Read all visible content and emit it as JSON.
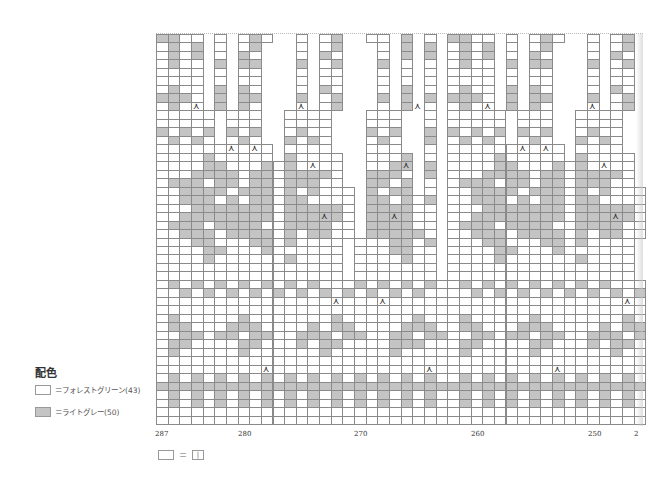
{
  "legend": {
    "title": "配色",
    "items": [
      {
        "swatch": "white",
        "label": "＝フォレストグリーン(43)"
      },
      {
        "swatch": "grey",
        "label": "＝ライトグレー(50)"
      }
    ]
  },
  "key": {
    "equals": "＝",
    "symbol": "|"
  },
  "axis": {
    "labels": [
      {
        "text": "287",
        "x": 155
      },
      {
        "text": "280",
        "x": 238
      },
      {
        "text": "270",
        "x": 354
      },
      {
        "text": "260",
        "x": 471
      },
      {
        "text": "250",
        "x": 588
      },
      {
        "text": "2",
        "x": 634
      }
    ]
  },
  "colors": {
    "white_cell": "#ffffff",
    "grey_cell": "#c4c4c4",
    "grid_line": "#8a8a8a"
  },
  "chart": {
    "left": 156,
    "top": 34,
    "cell_w": 11.65,
    "cell_h": 8.48,
    "rows": 46,
    "cols": 42,
    "repeat_width": 25,
    "motif": [
      "xxoo.o.oxo..o.ox..oo.x.o.",
      "oxox.o.ox...o.ox...o.x.x.",
      "oxox.o.xo...o.xo...o.x.x.",
      "oxoo.x.xx...x.ox...x.o.o.",
      "oooo.o.oo...o.oo...o.o.o.",
      "oooo.o.oo...o.oo...o.o.o.",
      "oxoo.x.xo...o.xo...o.x.o.",
      "xxxo.x.xx...x.ox...x.x.x.",
      "oxoo.x.xo...o.ox...o.x.o.",
      "ooooo.ooo..oooo...ooo..o.",
      "ooooo.ooo..oooo...ooo..o.",
      "xoxox.xox..oxoo...xox..x.",
      "oxoxo.oxo..xoxo...oxo..x.",
      "oooooooooo.oooo...ooo..o.",
      "ooooxooooo.xoooo..ooox.o.",
      "ooooxxoooxoxoooo..ooxx.x.",
      "oooxxxxoxxoxxxxo..xxxo.x.",
      "oxxxoxxoxxoxxxoo..xxox.o.",
      "ooxxxxoxxxoxoxooo.xoxx.o.",
      "ooxxxoxoxxoxxoooo.xxoxox.",
      "oooxxxxxxxoxxxxxo.xxxxoo.",
      "ooxxxxxxxxoxxxxxo.xxxxoo.",
      "oxxxoxxxxooxxxxoo.xxxxoo.",
      "ooxxxoxxxxoxoxxoo.xxxxxo.",
      "oooxxoooxxoxoooo.oooxxox.",
      "ooooxxoooxoooooo.oooxxoo.",
      "ooooxooooooxoooo.ooooxoo.",
      "oooooooooooooooo.ooooooo.",
      "oooooooooooooooo.ooooooo.",
      "oxoxoxoxoxoxoxoooxoxoxoxo",
      "ooxoxoxoxoxoxoxoxoxoxoxoo",
      "ooooooooooooooooooooooooo",
      "ooooooooooooooooooooooooo",
      "oxoooooxoooooooxooooooxoo",
      "oxxoooxxxooooxoxxooooxxxo",
      "ooxxoxxoxxooxxxoxxooxxoxx",
      "oxxooooxxoooxoxxooooxxxoo",
      "oxoooooxooooooxoooooxoooo",
      "ooooooooooooooooooooooooo",
      "ooooooooooooooooooooooooo",
      "oxoxoxoxoxoxoxoxoxoxoxoxo",
      "xxxxxxxxxxxxxxxxxxxxxxxxx",
      "oxoxoxoxoxoxoxoxoxoxoxoxo",
      "oxoxoxoxoxoxoxoxoxoxoxoxo",
      "ooooooooooooooooooooooooo",
      "ooooooooooooooooooooooooo"
    ],
    "decreases": [
      {
        "row": 8,
        "col": 3
      },
      {
        "row": 13,
        "col": 6
      },
      {
        "row": 13,
        "col": 8
      },
      {
        "row": 8,
        "col": 12
      },
      {
        "row": 15,
        "col": 13
      },
      {
        "row": 21,
        "col": 14
      },
      {
        "row": 31,
        "col": 15
      },
      {
        "row": 39,
        "col": 9
      },
      {
        "row": 8,
        "col": 22
      },
      {
        "row": 15,
        "col": 21
      },
      {
        "row": 21,
        "col": 20
      },
      {
        "row": 31,
        "col": 19
      },
      {
        "row": 39,
        "col": 23
      }
    ]
  }
}
